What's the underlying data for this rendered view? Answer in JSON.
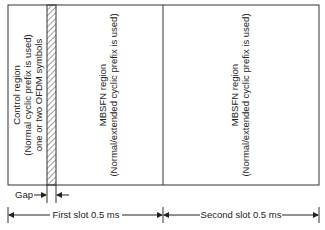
{
  "regions": {
    "control": {
      "lines": [
        "Control region",
        "(Normal cyclic prefix is used)",
        "one or two OFDM symbols"
      ]
    },
    "mbsfn_first": {
      "lines": [
        "MBSFN region",
        "(Normal/extended cyclic prefix is used)"
      ]
    },
    "mbsfn_second": {
      "lines": [
        "MBSFN region",
        "(Normal/extended cyclic prefix is used)"
      ]
    }
  },
  "annotations": {
    "gap": "Gap",
    "first_slot": "First slot 0.5 ms",
    "second_slot": "Second slot 0.5 ms"
  },
  "colors": {
    "line": "#333333"
  }
}
